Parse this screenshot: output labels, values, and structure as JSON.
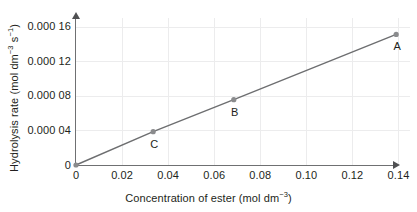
{
  "chart_data": {
    "type": "line",
    "title": "",
    "xlabel": "Concentration of ester (mol dm-3)",
    "ylabel": "Hydrolysis rate (mol dm-3 s-1)",
    "xlim": [
      0,
      0.145
    ],
    "ylim": [
      0,
      0.00017
    ],
    "grid": true,
    "legend": "none",
    "x_ticks": [
      0,
      0.02,
      0.04,
      0.06,
      0.08,
      0.1,
      0.12,
      0.14
    ],
    "x_tick_labels": [
      "0",
      "0.02",
      "0.04",
      "0.06",
      "0.08",
      "0.10",
      "0.12",
      "0.14"
    ],
    "y_ticks": [
      0,
      4e-05,
      8e-05,
      0.00012,
      0.00016
    ],
    "y_tick_labels": [
      "0",
      "0.000 04",
      "0.000 08",
      "0.000 12",
      "0.000 16"
    ],
    "series": [
      {
        "name": "Hydrolysis rate vs concentration",
        "x": [
          0,
          0.0335,
          0.0685,
          0.139
        ],
        "values": [
          0,
          3.85e-05,
          7.55e-05,
          0.000151
        ],
        "point_labels": [
          "",
          "C",
          "B",
          "A"
        ],
        "line_color": "#6d6e70",
        "marker_color": "#8a8b8d"
      }
    ],
    "annotations": [
      {
        "label": "A",
        "x": 0.139,
        "y": 0.000151
      },
      {
        "label": "B",
        "x": 0.0685,
        "y": 7.55e-05
      },
      {
        "label": "C",
        "x": 0.0335,
        "y": 3.85e-05
      }
    ]
  },
  "axis": {
    "y_title_prefix": "Hydrolysis rate (mol dm",
    "y_title_sup1": "-3",
    "y_title_mid": " s",
    "y_title_sup2": "-1",
    "y_title_suffix": ")",
    "x_title_prefix": "Concentration of ester (mol dm",
    "x_title_sup": "-3",
    "x_title_suffix": ")"
  },
  "colors": {
    "axis": "#6f7072",
    "grid": "#ececed",
    "line": "#6d6e70",
    "marker": "#8a8b8d",
    "text": "#231f20",
    "background": "#ffffff"
  }
}
